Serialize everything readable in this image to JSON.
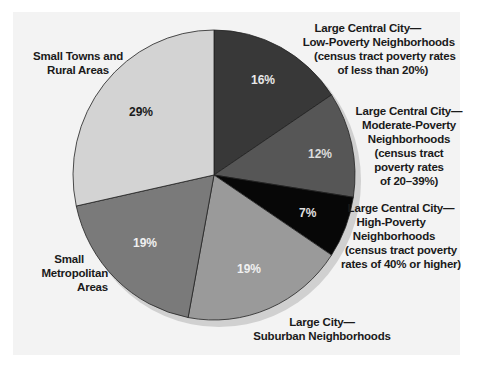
{
  "chart_data": {
    "type": "pie",
    "title": "",
    "start_angle": "12 o'clock",
    "direction": "clockwise",
    "slices": [
      {
        "label": "Large Central City—Low-Poverty Neighborhoods (census tract poverty rates of less than 20%)",
        "value": 16,
        "color": "#383838"
      },
      {
        "label": "Large Central City—Moderate-Poverty Neighborhoods (census tract poverty rates of 20–39%)",
        "value": 12,
        "color": "#565656"
      },
      {
        "label": "Large Central City—High-Poverty Neighborhoods (census tract poverty rates of 40% or higher)",
        "value": 7,
        "color": "#070707"
      },
      {
        "label": "Large City—Suburban Neighborhoods",
        "value": 19,
        "color": "#9a9a9a"
      },
      {
        "label": "Small Metropolitan Areas",
        "value": 19,
        "color": "#7a7a7a"
      },
      {
        "label": "Small Towns and Rural Areas",
        "value": 29,
        "color": "#d3d3d3"
      }
    ],
    "legend": "none (direct labels)"
  },
  "labels": {
    "low_poverty": [
      "Large Central City—",
      "Low-Poverty Neighborhoods",
      "(census tract poverty rates",
      "of less than 20%)"
    ],
    "moderate_poverty": [
      "Large Central City—",
      "Moderate-Poverty",
      "Neighborhoods",
      "(census tract",
      "poverty rates",
      "of 20–39%)"
    ],
    "high_poverty": [
      "Large Central City—",
      "High-Poverty",
      "Neighborhoods",
      "(census tract poverty",
      "rates of 40% or higher)"
    ],
    "suburban": [
      "Large City—",
      "Suburban Neighborhoods"
    ],
    "small_metro": [
      "Small",
      "Metropolitan",
      "Areas"
    ],
    "rural": [
      "Small Towns and",
      "Rural Areas"
    ]
  },
  "percents": {
    "low_poverty": "16%",
    "moderate_poverty": "12%",
    "high_poverty": "7%",
    "suburban": "19%",
    "small_metro": "19%",
    "rural": "29%"
  }
}
